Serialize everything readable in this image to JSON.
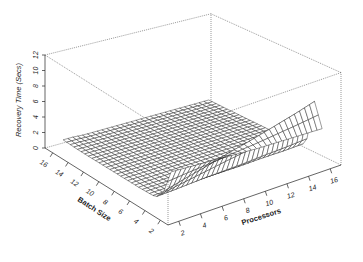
{
  "chart_data": {
    "type": "surface3d",
    "title": "",
    "xlabel": "Processors",
    "ylabel": "Batch Size",
    "zlabel": "Recovery Time (Secs)",
    "x_ticks": [
      2,
      4,
      6,
      8,
      10,
      12,
      14,
      16
    ],
    "y_ticks": [
      2,
      4,
      6,
      8,
      10,
      12,
      14,
      16
    ],
    "z_ticks": [
      0,
      2,
      4,
      6,
      8,
      10,
      12
    ],
    "xlim": [
      1,
      17
    ],
    "ylim": [
      1,
      17
    ],
    "zlim": [
      0,
      12
    ],
    "grid_x": [
      2,
      3,
      4,
      6,
      8,
      10,
      12,
      14,
      16
    ],
    "grid_y": [
      2,
      3,
      4,
      6,
      8,
      10,
      12,
      14,
      16
    ],
    "z_values_note": "rows = batch size (grid_y), cols = processors (grid_x)",
    "z_values": [
      [
        5.8,
        5.7,
        5.6,
        5.4,
        5.2,
        5.0,
        4.9,
        4.8,
        4.7
      ],
      [
        2.5,
        2.9,
        3.3,
        4.0,
        4.8,
        5.5,
        6.3,
        7.1,
        8.0
      ],
      [
        1.3,
        1.3,
        1.3,
        1.4,
        1.4,
        1.4,
        1.5,
        1.5,
        1.6
      ],
      [
        1.2,
        1.2,
        1.2,
        1.2,
        1.2,
        1.2,
        1.2,
        1.2,
        1.2
      ],
      [
        1.2,
        1.2,
        1.2,
        1.2,
        1.2,
        1.2,
        1.2,
        1.2,
        1.2
      ],
      [
        1.2,
        1.2,
        1.2,
        1.2,
        1.2,
        1.2,
        1.2,
        1.2,
        1.2
      ],
      [
        1.2,
        1.2,
        1.2,
        1.2,
        1.2,
        1.2,
        1.2,
        1.2,
        1.2
      ],
      [
        1.2,
        1.2,
        1.2,
        1.2,
        1.2,
        1.2,
        1.2,
        1.2,
        1.2
      ],
      [
        1.3,
        1.3,
        1.2,
        1.2,
        1.2,
        1.2,
        1.2,
        1.2,
        1.2
      ]
    ],
    "mesh_color": "#222222",
    "face_color": "#ffffff",
    "box_color": "#555555",
    "box_style": "dotted"
  }
}
